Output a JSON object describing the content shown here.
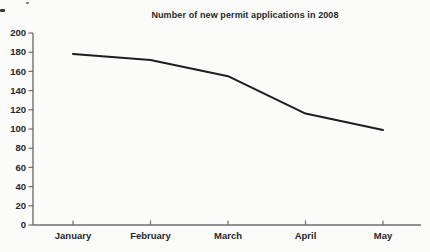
{
  "chart_data": {
    "type": "line",
    "title": "Number of new permit applications in 2008",
    "categories": [
      "January",
      "February",
      "March",
      "April",
      "May"
    ],
    "values": [
      178,
      172,
      155,
      116,
      99
    ],
    "xlabel": "",
    "ylabel": "",
    "ylim": [
      0,
      200
    ],
    "ytick_step": 20,
    "grid": false,
    "legend": "none",
    "line_color": "#1d1e20",
    "axis_color": "#6e6f71",
    "text_color": "#26272a"
  }
}
